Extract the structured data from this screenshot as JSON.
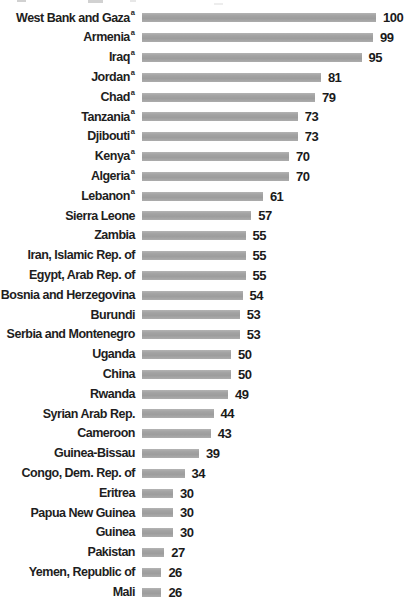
{
  "chart_data": {
    "type": "bar",
    "orientation": "horizontal",
    "title": "",
    "xlabel": "",
    "ylabel": "",
    "xlim": [
      0,
      100
    ],
    "grid": false,
    "legend": false,
    "value_label_position": "right-of-bar-end",
    "bar_color": "#a3a3a3",
    "label_color": "#1e1e1e",
    "footnote_marker": "a",
    "footnote_on": [
      "West Bank and Gaza",
      "Armenia",
      "Iraq",
      "Jordan",
      "Chad",
      "Tanzania",
      "Djibouti",
      "Kenya",
      "Algeria",
      "Lebanon"
    ],
    "categories": [
      "West Bank and Gaza",
      "Armenia",
      "Iraq",
      "Jordan",
      "Chad",
      "Tanzania",
      "Djibouti",
      "Kenya",
      "Algeria",
      "Lebanon",
      "Sierra Leone",
      "Zambia",
      "Iran, Islamic Rep. of",
      "Egypt, Arab Rep. of",
      "Bosnia and Herzegovina",
      "Burundi",
      "Serbia and Montenegro",
      "Uganda",
      "China",
      "Rwanda",
      "Syrian Arab Rep.",
      "Cameroon",
      "Guinea-Bissau",
      "Congo, Dem. Rep. of",
      "Eritrea",
      "Papua New Guinea",
      "Guinea",
      "Pakistan",
      "Yemen, Republic of",
      "Mali"
    ],
    "values": [
      100,
      99,
      95,
      81,
      79,
      73,
      73,
      70,
      70,
      61,
      57,
      55,
      55,
      55,
      54,
      53,
      53,
      50,
      50,
      49,
      44,
      43,
      39,
      34,
      30,
      30,
      30,
      27,
      26,
      26
    ]
  }
}
